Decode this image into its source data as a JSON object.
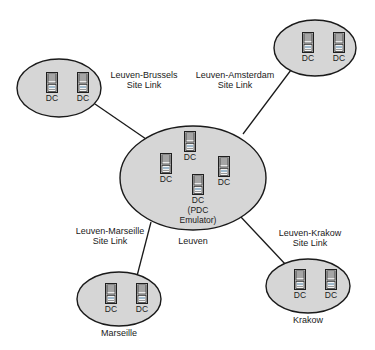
{
  "diagram": {
    "type": "network-topology",
    "background_color": "#ffffff",
    "site_fill_color": "#d6d6d6",
    "line_color": "#1a1a1a",
    "server_icon_name": "server-icon",
    "dc_label": "DC",
    "sites": [
      {
        "id": "brussels",
        "name": "Brussels",
        "caption": "",
        "cx": 59,
        "cy": 88,
        "rx": 42,
        "ry": 29,
        "servers": [
          {
            "label": "DC",
            "x": 45,
            "y": 72
          },
          {
            "label": "DC",
            "x": 76,
            "y": 72
          }
        ]
      },
      {
        "id": "amsterdam",
        "name": "Amsterdam",
        "caption": "",
        "cx": 315,
        "cy": 48,
        "rx": 41,
        "ry": 28,
        "servers": [
          {
            "label": "DC",
            "x": 301,
            "y": 32
          },
          {
            "label": "DC",
            "x": 332,
            "y": 32
          }
        ]
      },
      {
        "id": "leuven",
        "name": "Leuven",
        "caption": "Leuven",
        "caption_x": 193,
        "caption_y": 236,
        "cx": 193,
        "cy": 178,
        "rx": 73,
        "ry": 52,
        "servers": [
          {
            "label": "DC",
            "x": 183,
            "y": 131
          },
          {
            "label": "DC",
            "x": 159,
            "y": 153
          },
          {
            "label": "DC",
            "x": 217,
            "y": 156
          },
          {
            "label": "DC",
            "x": 191,
            "y": 174,
            "sublabel1": "(PDC",
            "sublabel2": "Emulator)"
          }
        ]
      },
      {
        "id": "marseille",
        "name": "Marseille",
        "caption": "Marseille",
        "caption_x": 119,
        "caption_y": 328,
        "cx": 119,
        "cy": 299,
        "rx": 42,
        "ry": 27,
        "servers": [
          {
            "label": "DC",
            "x": 104,
            "y": 283
          },
          {
            "label": "DC",
            "x": 135,
            "y": 283
          }
        ]
      },
      {
        "id": "krakow",
        "name": "Krakow",
        "caption": "Krakow",
        "caption_x": 308,
        "caption_y": 315,
        "cx": 308,
        "cy": 286,
        "rx": 42,
        "ry": 27,
        "servers": [
          {
            "label": "DC",
            "x": 293,
            "y": 269
          },
          {
            "label": "DC",
            "x": 324,
            "y": 269
          }
        ]
      }
    ],
    "site_links": [
      {
        "id": "leuven-brussels",
        "line1": "Leuven-Brussels",
        "line2": "Site Link",
        "label_x": 144,
        "label_y": 70,
        "x1": 95,
        "y1": 104,
        "x2": 146,
        "y2": 139
      },
      {
        "id": "leuven-amsterdam",
        "line1": "Leuven-Amsterdam",
        "line2": "Site Link",
        "label_x": 235,
        "label_y": 70,
        "x1": 291,
        "y1": 70,
        "x2": 243,
        "y2": 134
      },
      {
        "id": "leuven-marseille",
        "line1": "Leuven-Marseille",
        "line2": "Site Link",
        "label_x": 110,
        "label_y": 226,
        "x1": 151,
        "y1": 222,
        "x2": 137,
        "y2": 276
      },
      {
        "id": "leuven-krakow",
        "line1": "Leuven-Krakow",
        "line2": "Site Link",
        "label_x": 310,
        "label_y": 228,
        "x1": 240,
        "y1": 216,
        "x2": 286,
        "y2": 265
      }
    ]
  }
}
